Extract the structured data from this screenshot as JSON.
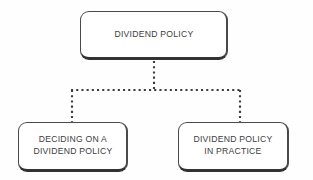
{
  "diagram": {
    "background_color": "#fefefe",
    "border_color": "#4a4a4a",
    "text_color": "#3d3d3d",
    "connector_color": "#3d3d3d",
    "connector_style": "dotted",
    "nodes": {
      "root": {
        "label": "DIVIDEND POLICY",
        "x": 80,
        "y": 11,
        "width": 148,
        "height": 49
      },
      "left": {
        "label": "DECIDING ON A\nDIVIDEND POLICY",
        "x": 18,
        "y": 122,
        "width": 110,
        "height": 50
      },
      "right": {
        "label": "DIVIDEND POLICY\nIN PRACTICE",
        "x": 178,
        "y": 122,
        "width": 111,
        "height": 50
      }
    },
    "connectors": {
      "trunk_x": 154,
      "trunk_top_y": 60,
      "bus_y": 90,
      "bus_left_x": 72,
      "bus_right_x": 240,
      "branch_bottom_y": 122
    }
  }
}
